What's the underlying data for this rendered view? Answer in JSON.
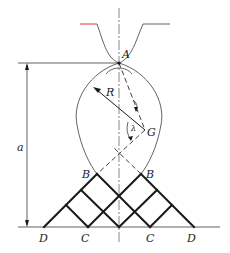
{
  "figure": {
    "type": "geometric construction diagram",
    "colors": {
      "ink": "#1a1a1a",
      "top_left_edge": "#d23a4a",
      "background": "#ffffff"
    },
    "labels": {
      "A": "A",
      "R": "R",
      "G": "G",
      "lambda": "λ",
      "B_left": "B",
      "B_right": "B",
      "C_left": "C",
      "C_right": "C",
      "D_left": "D",
      "D_right": "D",
      "a": "a"
    },
    "dimension": {
      "name": "a",
      "description": "vertical distance from point A level to baseline"
    }
  }
}
